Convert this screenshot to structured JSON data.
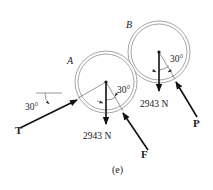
{
  "figure": {
    "caption": "(e)",
    "colors": {
      "ink": "#111111",
      "circle": "#9a9a9a",
      "construction": "#555555"
    }
  },
  "bodies": [
    {
      "id": "A",
      "label": "A",
      "weight_label": "2943 N",
      "angle_label": "30°"
    },
    {
      "id": "B",
      "label": "B",
      "weight_label": "2943 N",
      "angle_label": "30°"
    }
  ],
  "forces": [
    {
      "name": "T",
      "label": "T",
      "angle_label": "30°",
      "reference": "horizontal"
    },
    {
      "name": "F",
      "label": "F"
    },
    {
      "name": "P",
      "label": "P"
    }
  ]
}
